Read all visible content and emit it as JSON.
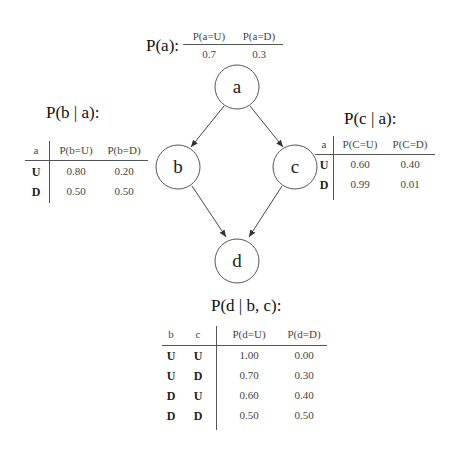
{
  "diagram": {
    "type": "bayesian-network",
    "nodes": [
      {
        "id": "a",
        "label": "a"
      },
      {
        "id": "b",
        "label": "b"
      },
      {
        "id": "c",
        "label": "c"
      },
      {
        "id": "d",
        "label": "d"
      }
    ],
    "edges": [
      {
        "from": "a",
        "to": "b"
      },
      {
        "from": "a",
        "to": "c"
      },
      {
        "from": "b",
        "to": "d"
      },
      {
        "from": "c",
        "to": "d"
      }
    ]
  },
  "cpt_a": {
    "title": "P(a):",
    "headers": [
      "P(a=U)",
      "P(a=D)"
    ],
    "values": [
      "0.7",
      "0.3"
    ]
  },
  "cpt_b": {
    "title": "P(b | a):",
    "headers": [
      "a",
      "P(b=U)",
      "P(b=D)"
    ],
    "rows": [
      {
        "a": "U",
        "pu": "0.80",
        "pd": "0.20"
      },
      {
        "a": "D",
        "pu": "0.50",
        "pd": "0.50"
      }
    ]
  },
  "cpt_c": {
    "title": "P(c | a):",
    "headers": [
      "a",
      "P(C=U)",
      "P(C=D)"
    ],
    "rows": [
      {
        "a": "U",
        "pu": "0.60",
        "pd": "0.40"
      },
      {
        "a": "D",
        "pu": "0.99",
        "pd": "0.01"
      }
    ]
  },
  "cpt_d": {
    "title": "P(d | b, c):",
    "headers": [
      "b",
      "c",
      "P(d=U)",
      "P(d=D)"
    ],
    "rows": [
      {
        "b": "U",
        "c": "U",
        "pu": "1.00",
        "pd": "0.00"
      },
      {
        "b": "U",
        "c": "D",
        "pu": "0.70",
        "pd": "0.30"
      },
      {
        "b": "D",
        "c": "U",
        "pu": "0.60",
        "pd": "0.40"
      },
      {
        "b": "D",
        "c": "D",
        "pu": "0.50",
        "pd": "0.50"
      }
    ]
  }
}
